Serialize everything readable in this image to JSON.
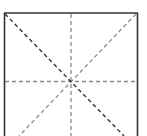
{
  "diagram": {
    "type": "square-grid-guide",
    "elements": [
      "outer-square",
      "vertical-midline",
      "horizontal-midline",
      "main-diagonal",
      "anti-diagonal"
    ],
    "colors": {
      "background": "#ffffff",
      "border": "#333333",
      "main_diagonal": "#333333",
      "guide_lines": "#8a8a8a"
    }
  }
}
